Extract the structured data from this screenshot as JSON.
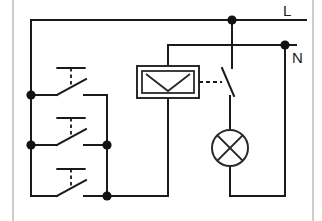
{
  "diagram": {
    "type": "electrical-schematic",
    "canvas": {
      "width": 322,
      "height": 221,
      "background": "#ffffff"
    },
    "line_color": "#1a1a1a",
    "border_color": "#b8b8b8"
  },
  "terminals": [
    {
      "id": "L",
      "label": "L",
      "description": "line / live supply rail",
      "x": 283,
      "y": 12
    },
    {
      "id": "N",
      "label": "N",
      "description": "neutral supply rail",
      "x": 292,
      "y": 58
    }
  ],
  "components": {
    "pushbuttons": [
      {
        "id": "sb1",
        "name": "pushbutton-switch-1",
        "type": "normally-open-momentary",
        "x": 62,
        "y": 95
      },
      {
        "id": "sb2",
        "name": "pushbutton-switch-2",
        "type": "normally-open-momentary",
        "x": 62,
        "y": 145
      },
      {
        "id": "sb3",
        "name": "pushbutton-switch-3",
        "type": "normally-open-momentary",
        "x": 62,
        "y": 196
      }
    ],
    "relay_coil": {
      "name": "relay-coil",
      "symbol": "coil-box-with-v-marking",
      "x": 137,
      "y": 66,
      "width": 62,
      "height": 32
    },
    "relay_contact": {
      "name": "relay-contact",
      "type": "normally-open",
      "x": 213,
      "y": 68,
      "linked_to": "relay-coil",
      "link_style": "dashed"
    },
    "lamp": {
      "name": "signal-lamp",
      "symbol": "circle-with-cross",
      "cx": 230,
      "cy": 148,
      "r": 18
    }
  },
  "junctions": [
    {
      "name": "junction-L-tap",
      "x": 232,
      "y": 20
    },
    {
      "name": "junction-N-tap",
      "x": 285,
      "y": 45
    },
    {
      "name": "junction-left-rail-1",
      "x": 31,
      "y": 95
    },
    {
      "name": "junction-left-rail-2",
      "x": 31,
      "y": 145
    },
    {
      "name": "junction-mid-bus",
      "x": 107,
      "y": 145
    },
    {
      "name": "junction-bottom-bus",
      "x": 107,
      "y": 196
    }
  ],
  "nets": {
    "line_rail": "L rail runs horizontally at top (y=20) from x=31 to the right edge",
    "neutral_rail": "N rail runs horizontally at y=45 from x=160 to x=296",
    "left_rail": "vertical conductor at x=31 linking the top rail to the pushbutton inputs",
    "common_return": "vertical conductor at x=107 joining pushbutton outputs to the coil return"
  }
}
